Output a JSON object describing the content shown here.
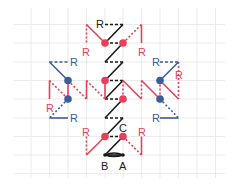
{
  "colors": {
    "red": "#e8405a",
    "blue": "#3b5d9a",
    "black": "#1a1a1a",
    "grid": "#e6e6e6",
    "background": "#ffffff"
  },
  "grid": {
    "x": [
      31,
      49.5,
      68,
      86.5,
      105,
      123,
      141.5,
      160,
      178.5,
      197,
      215.5
    ],
    "y": [
      24.5,
      43,
      62,
      80.5,
      99,
      118,
      136.5,
      155,
      173.5
    ],
    "x_extent": [
      14,
      225
    ],
    "y_extent": [
      8,
      178
    ]
  },
  "labels": {
    "A": "A",
    "B": "B",
    "C": "C",
    "R": "R"
  },
  "label_positions": [
    {
      "text": "R",
      "x": 96,
      "y": 28,
      "color": "black"
    },
    {
      "text": "R",
      "x": 82,
      "y": 56,
      "color": "red"
    },
    {
      "text": "R",
      "x": 138,
      "y": 56,
      "color": "red"
    },
    {
      "text": "R",
      "x": 70,
      "y": 66,
      "color": "blue"
    },
    {
      "text": "R",
      "x": 152,
      "y": 66,
      "color": "blue"
    },
    {
      "text": "R",
      "x": 175,
      "y": 79,
      "color": "red"
    },
    {
      "text": "R",
      "x": 46,
      "y": 112,
      "color": "red"
    },
    {
      "text": "R",
      "x": 70,
      "y": 122,
      "color": "blue"
    },
    {
      "text": "R",
      "x": 152,
      "y": 122,
      "color": "blue"
    },
    {
      "text": "R",
      "x": 82,
      "y": 136,
      "color": "red"
    },
    {
      "text": "R",
      "x": 138,
      "y": 136,
      "color": "red"
    },
    {
      "text": "C",
      "x": 119,
      "y": 132,
      "color": "black"
    },
    {
      "text": "B",
      "x": 101,
      "y": 170,
      "color": "black"
    },
    {
      "text": "A",
      "x": 119,
      "y": 170,
      "color": "black"
    }
  ],
  "segments": [
    {
      "x1": 105,
      "y1": 24.5,
      "x2": 123,
      "y2": 24.5,
      "color": "black",
      "style": "dashed"
    },
    {
      "x1": 123,
      "y1": 24.5,
      "x2": 105,
      "y2": 43,
      "color": "black",
      "style": "solid"
    },
    {
      "x1": 105,
      "y1": 43,
      "x2": 123,
      "y2": 43,
      "color": "black",
      "style": "dashed"
    },
    {
      "x1": 123,
      "y1": 43,
      "x2": 105,
      "y2": 62,
      "color": "black",
      "style": "solid"
    },
    {
      "x1": 105,
      "y1": 62,
      "x2": 123,
      "y2": 62,
      "color": "black",
      "style": "dashed"
    },
    {
      "x1": 123,
      "y1": 62,
      "x2": 105,
      "y2": 80.5,
      "color": "black",
      "style": "solid"
    },
    {
      "x1": 105,
      "y1": 80.5,
      "x2": 123,
      "y2": 80.5,
      "color": "black",
      "style": "dashed"
    },
    {
      "x1": 123,
      "y1": 80.5,
      "x2": 105,
      "y2": 99,
      "color": "black",
      "style": "solid"
    },
    {
      "x1": 105,
      "y1": 99,
      "x2": 123,
      "y2": 99,
      "color": "black",
      "style": "dashed"
    },
    {
      "x1": 123,
      "y1": 99,
      "x2": 105,
      "y2": 118,
      "color": "black",
      "style": "solid"
    },
    {
      "x1": 105,
      "y1": 118,
      "x2": 123,
      "y2": 118,
      "color": "black",
      "style": "dashed"
    },
    {
      "x1": 123,
      "y1": 118,
      "x2": 105,
      "y2": 136.5,
      "color": "black",
      "style": "solid"
    },
    {
      "x1": 105,
      "y1": 136.5,
      "x2": 123,
      "y2": 136.5,
      "color": "black",
      "style": "dashed"
    },
    {
      "x1": 123,
      "y1": 136.5,
      "x2": 105,
      "y2": 155,
      "color": "black",
      "style": "solid"
    },
    {
      "x1": 105,
      "y1": 155,
      "x2": 123,
      "y2": 155,
      "color": "black",
      "style": "solid"
    },
    {
      "x1": 86.5,
      "y1": 24.5,
      "x2": 105,
      "y2": 43,
      "color": "red",
      "style": "solid"
    },
    {
      "x1": 86.5,
      "y1": 24.5,
      "x2": 86.5,
      "y2": 43,
      "color": "red",
      "style": "dotted"
    },
    {
      "x1": 123,
      "y1": 43,
      "x2": 141.5,
      "y2": 24.5,
      "color": "red",
      "style": "dotted"
    },
    {
      "x1": 141.5,
      "y1": 24.5,
      "x2": 141.5,
      "y2": 43,
      "color": "red",
      "style": "solid"
    },
    {
      "x1": 49.5,
      "y1": 80.5,
      "x2": 49.5,
      "y2": 99,
      "color": "red",
      "style": "solid"
    },
    {
      "x1": 49.5,
      "y1": 80.5,
      "x2": 68,
      "y2": 99,
      "color": "red",
      "style": "dotted"
    },
    {
      "x1": 68,
      "y1": 80.5,
      "x2": 68,
      "y2": 99,
      "color": "red",
      "style": "solid"
    },
    {
      "x1": 68,
      "y1": 80.5,
      "x2": 86.5,
      "y2": 99,
      "color": "red",
      "style": "dotted"
    },
    {
      "x1": 86.5,
      "y1": 80.5,
      "x2": 86.5,
      "y2": 99,
      "color": "red",
      "style": "solid"
    },
    {
      "x1": 86.5,
      "y1": 80.5,
      "x2": 105,
      "y2": 99,
      "color": "red",
      "style": "dotted"
    },
    {
      "x1": 105,
      "y1": 80.5,
      "x2": 105,
      "y2": 99,
      "color": "red",
      "style": "solid"
    },
    {
      "x1": 123,
      "y1": 80.5,
      "x2": 123,
      "y2": 99,
      "color": "red",
      "style": "dotted"
    },
    {
      "x1": 123,
      "y1": 80.5,
      "x2": 141.5,
      "y2": 99,
      "color": "red",
      "style": "solid"
    },
    {
      "x1": 141.5,
      "y1": 80.5,
      "x2": 141.5,
      "y2": 99,
      "color": "red",
      "style": "dotted"
    },
    {
      "x1": 141.5,
      "y1": 80.5,
      "x2": 160,
      "y2": 99,
      "color": "red",
      "style": "solid"
    },
    {
      "x1": 160,
      "y1": 80.5,
      "x2": 160,
      "y2": 99,
      "color": "red",
      "style": "dotted"
    },
    {
      "x1": 160,
      "y1": 80.5,
      "x2": 178.5,
      "y2": 99,
      "color": "red",
      "style": "solid"
    },
    {
      "x1": 178.5,
      "y1": 62,
      "x2": 178.5,
      "y2": 99,
      "color": "red",
      "style": "dotted"
    },
    {
      "x1": 49.5,
      "y1": 62,
      "x2": 68,
      "y2": 62,
      "color": "blue",
      "style": "dashed"
    },
    {
      "x1": 49.5,
      "y1": 62,
      "x2": 68,
      "y2": 80.5,
      "color": "blue",
      "style": "solid"
    },
    {
      "x1": 68,
      "y1": 99,
      "x2": 49.5,
      "y2": 118,
      "color": "blue",
      "style": "dotted"
    },
    {
      "x1": 49.5,
      "y1": 118,
      "x2": 68,
      "y2": 118,
      "color": "blue",
      "style": "solid"
    },
    {
      "x1": 160,
      "y1": 62,
      "x2": 178.5,
      "y2": 62,
      "color": "blue",
      "style": "dashed"
    },
    {
      "x1": 160,
      "y1": 80.5,
      "x2": 178.5,
      "y2": 62,
      "color": "blue",
      "style": "solid"
    },
    {
      "x1": 160,
      "y1": 99,
      "x2": 178.5,
      "y2": 118,
      "color": "blue",
      "style": "dotted"
    },
    {
      "x1": 160,
      "y1": 118,
      "x2": 178.5,
      "y2": 118,
      "color": "blue",
      "style": "solid"
    },
    {
      "x1": 86.5,
      "y1": 155,
      "x2": 105,
      "y2": 136.5,
      "color": "red",
      "style": "solid"
    },
    {
      "x1": 86.5,
      "y1": 136.5,
      "x2": 86.5,
      "y2": 155,
      "color": "red",
      "style": "dotted"
    },
    {
      "x1": 123,
      "y1": 136.5,
      "x2": 141.5,
      "y2": 155,
      "color": "red",
      "style": "dotted"
    },
    {
      "x1": 141.5,
      "y1": 136.5,
      "x2": 141.5,
      "y2": 155,
      "color": "red",
      "style": "solid"
    }
  ],
  "points": [
    {
      "x": 105,
      "y": 43,
      "color": "red"
    },
    {
      "x": 123,
      "y": 43,
      "color": "red"
    },
    {
      "x": 105,
      "y": 80.5,
      "color": "red"
    },
    {
      "x": 123,
      "y": 99,
      "color": "red"
    },
    {
      "x": 105,
      "y": 136.5,
      "color": "red"
    },
    {
      "x": 123,
      "y": 136.5,
      "color": "red"
    },
    {
      "x": 68,
      "y": 80.5,
      "color": "blue"
    },
    {
      "x": 68,
      "y": 99,
      "color": "blue"
    },
    {
      "x": 160,
      "y": 80.5,
      "color": "blue"
    },
    {
      "x": 160,
      "y": 99,
      "color": "blue"
    },
    {
      "x": 105,
      "y": 155,
      "color": "black",
      "small": true
    },
    {
      "x": 123,
      "y": 155,
      "color": "black",
      "small": true
    }
  ],
  "arc": {
    "x1": 105,
    "y1": 155,
    "x2": 123,
    "y2": 155,
    "color": "black"
  }
}
